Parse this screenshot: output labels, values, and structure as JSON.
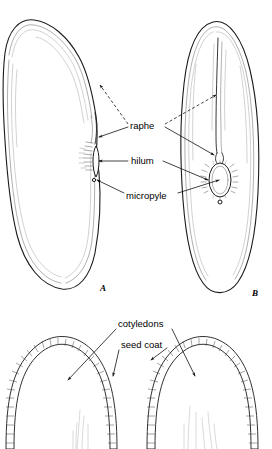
{
  "figure": {
    "background_color": "#ffffff",
    "ink_color": "#1a1a1a",
    "width": 272,
    "height": 449
  },
  "panels": [
    {
      "id": "A",
      "letter": "A",
      "caption": "A",
      "view": "side view of bean seed",
      "letter_x": 103,
      "letter_y": 289
    },
    {
      "id": "B",
      "letter": "B",
      "caption": "B",
      "view": "edge view of bean seed",
      "letter_x": 255,
      "letter_y": 294
    }
  ],
  "labels": {
    "raphe": {
      "text": "raphe",
      "x": 130,
      "y": 126,
      "anchor": "start"
    },
    "hilum": {
      "text": "hilum",
      "x": 131,
      "y": 161,
      "anchor": "start"
    },
    "micropyle": {
      "text": "micropyle",
      "x": 126,
      "y": 196,
      "anchor": "start"
    },
    "cotyledons": {
      "text": "cotyledons",
      "x": 118,
      "y": 324,
      "anchor": "start"
    },
    "seed_coat": {
      "text": "seed coat",
      "x": 121,
      "y": 345,
      "anchor": "start"
    }
  },
  "structures": [
    {
      "name": "raphe",
      "description": "ridge running from hilum along the seed"
    },
    {
      "name": "hilum",
      "description": "scar where seed attached to pod"
    },
    {
      "name": "micropyle",
      "description": "small pore beside the hilum"
    },
    {
      "name": "cotyledons",
      "description": "seed leaves filling the seed interior"
    },
    {
      "name": "seed coat",
      "description": "outer protective layer, testa"
    }
  ]
}
